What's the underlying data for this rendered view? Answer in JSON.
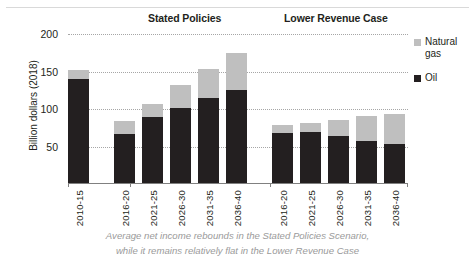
{
  "chart_data": {
    "type": "bar",
    "title": "",
    "xlabel": "",
    "ylabel": "Billion dollars (2018)",
    "ylim": [
      0,
      200
    ],
    "yticks": [
      50,
      100,
      150,
      200
    ],
    "grid": true,
    "stacked": true,
    "legend_position": "right",
    "group_labels": [
      "Stated Policies",
      "Lower Revenue Case"
    ],
    "categories": [
      "2010-15",
      "2016-20",
      "2021-25",
      "2026-30",
      "2031-35",
      "2036-40",
      "2016-20",
      "2021-25",
      "2026-30",
      "2031-35",
      "2036-40"
    ],
    "groups": [
      "Historical",
      "Stated Policies",
      "Stated Policies",
      "Stated Policies",
      "Stated Policies",
      "Stated Policies",
      "Lower Revenue Case",
      "Lower Revenue Case",
      "Lower Revenue Case",
      "Lower Revenue Case",
      "Lower Revenue Case"
    ],
    "series": [
      {
        "name": "Oil",
        "color": "#231f20",
        "values": [
          140,
          66,
          89,
          101,
          114,
          125,
          67,
          68,
          63,
          57,
          53
        ]
      },
      {
        "name": "Natural gas",
        "color": "#bfbfbf",
        "values": [
          12,
          17,
          17,
          30,
          39,
          50,
          11,
          12,
          21,
          33,
          40
        ]
      }
    ],
    "totals": [
      152,
      83,
      106,
      131,
      153,
      175,
      78,
      80,
      84,
      90,
      93
    ],
    "legend": [
      {
        "label": "Natural gas",
        "color": "#bfbfbf"
      },
      {
        "label": "Oil",
        "color": "#231f20"
      }
    ]
  },
  "yticks": {
    "t200": "200",
    "t150": "150",
    "t100": "100",
    "t50": "50"
  },
  "axis": {
    "y_title": "Billion dollars (2018)"
  },
  "groups": {
    "stated": "Stated Policies",
    "lower": "Lower Revenue Case"
  },
  "legend": {
    "gas": "Natural gas",
    "oil": "Oil"
  },
  "categories": {
    "c0": "2010-15",
    "c1": "2016-20",
    "c2": "2021-25",
    "c3": "2026-30",
    "c4": "2031-35",
    "c5": "2036-40",
    "c6": "2016-20",
    "c7": "2021-25",
    "c8": "2026-30",
    "c9": "2031-35",
    "c10": "2036-40"
  },
  "caption": {
    "line1": "Average net income rebounds in the Stated Policies Scenario,",
    "line2": "while it remains relatively flat in the Lower Revenue Case"
  }
}
